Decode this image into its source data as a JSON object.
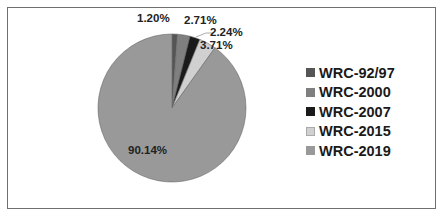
{
  "chart_data": {
    "type": "pie",
    "title": "",
    "start_angle": "12 o'clock",
    "direction": "clockwise",
    "categories": [
      "WRC-92/97",
      "WRC-2000",
      "WRC-2007",
      "WRC-2015",
      "WRC-2019"
    ],
    "values": [
      1.2,
      2.71,
      2.24,
      3.71,
      90.14
    ],
    "data_labels": [
      "1.20%",
      "2.71%",
      "2.24%",
      "3.71%",
      "90.14%"
    ],
    "colors": [
      "#555555",
      "#7f7f7f",
      "#1a1a1a",
      "#d0d0d0",
      "#999999"
    ],
    "legend_position": "right"
  },
  "legend": {
    "items": [
      {
        "label": "WRC-92/97",
        "color": "#555555"
      },
      {
        "label": "WRC-2000",
        "color": "#7f7f7f"
      },
      {
        "label": "WRC-2007",
        "color": "#1a1a1a"
      },
      {
        "label": "WRC-2015",
        "color": "#d0d0d0"
      },
      {
        "label": "WRC-2019",
        "color": "#999999"
      }
    ]
  },
  "labels": {
    "l0": "1.20%",
    "l1": "2.71%",
    "l2": "2.24%",
    "l3": "3.71%",
    "l4": "90.14%"
  }
}
